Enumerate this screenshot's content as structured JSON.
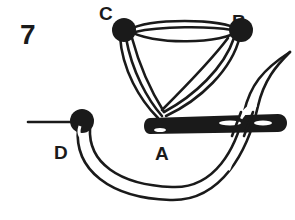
{
  "diagram": {
    "step_number": "7",
    "points": {
      "a": "A",
      "b": "B",
      "c": "C",
      "d": "D"
    },
    "elements": [
      "needle",
      "thread",
      "lazy-daisy-triangle-stitch"
    ],
    "colors": {
      "ink": "#1a1a1a",
      "background": "#ffffff"
    }
  }
}
